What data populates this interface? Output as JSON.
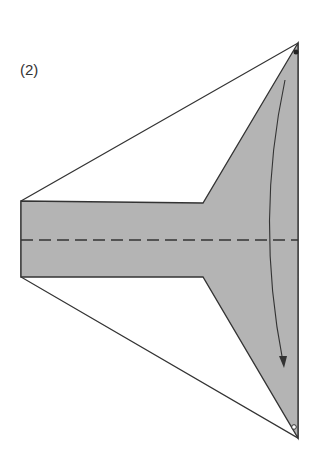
{
  "diagram": {
    "step_label": "(2)",
    "type": "origami fold diagram",
    "colors": {
      "paper_fill": "#b4b4b4",
      "outline": "#333333",
      "background": "#ffffff"
    },
    "elements": [
      "outer kite outline (white)",
      "shaded inner T/funnel region",
      "horizontal dashed valley-fold line",
      "curved arrow from top corner downward",
      "dot marker at top corner",
      "circle marker at bottom corner"
    ]
  }
}
